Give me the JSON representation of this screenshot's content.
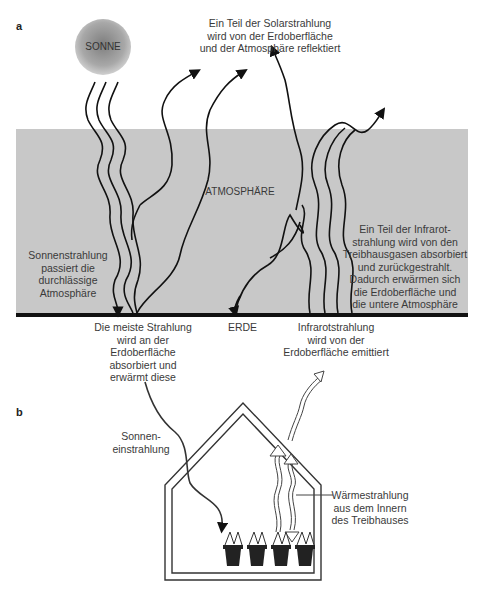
{
  "panel_a": {
    "letter": "a",
    "sun_label": "SONNE",
    "atmosphere_label": "ATMOSPHÄRE",
    "earth_label": "ERDE",
    "reflected_text": "Ein Teil der Solarstrahlung\nwird von der Erdoberfläche\nund der Atmosphäre reflektiert",
    "passes_text": "Sonnenstrahlung\npassiert die\ndurchlässige\nAtmosphäre",
    "absorbed_text": "Die meiste Strahlung\nwird an der\nErdoberfläche\nabsorbiert und\nerwärmt diese",
    "emitted_text": "Infrarotstrahlung\nwird von der\nErdoberfläche emittiert",
    "greenhouse_gas_text": "Ein Teil der Infrarot-\nstrahlung wird von den\nTreibhausgasen absorbiert\nund zurückgestrahlt.\nDadurch erwärmen sich\ndie Erdoberfläche und\ndie untere Atmosphäre",
    "colors": {
      "atmosphere": "#c8c8c8",
      "ground": "#111111",
      "sun": "#9a9a9a"
    }
  },
  "panel_b": {
    "letter": "b",
    "solar_in_text": "Sonnen-\neinstrahlung",
    "heat_text": "Wärmestrahlung\naus dem Innern\ndes Treibhauses",
    "pot_count": 4
  }
}
